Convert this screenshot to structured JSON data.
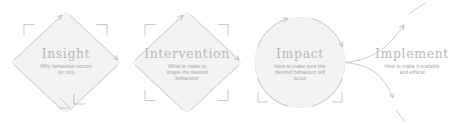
{
  "diagram": {
    "name": "behaviour-change-process",
    "colors": {
      "shape_fill": "#f3f3f3",
      "shape_stroke": "#e3e3e3",
      "arrow_stroke": "#b0b0b0",
      "title_text": "#b9b9b9",
      "desc_text": "#a8a8a8",
      "background": "#ffffff"
    },
    "stages": [
      {
        "id": "insight",
        "shape": "diamond",
        "title": "Insight",
        "desc_lines": [
          "Why behaviour occurs",
          "(or not)"
        ]
      },
      {
        "id": "intervention",
        "shape": "diamond",
        "title": "Intervention",
        "desc_lines": [
          "What to make to",
          "shape the desired",
          "behaviour"
        ]
      },
      {
        "id": "impact",
        "shape": "circle",
        "title": "Impact",
        "desc_lines": [
          "How to make sure the",
          "desired behaviour will",
          "occur"
        ]
      },
      {
        "id": "implement",
        "shape": "none",
        "title": "Implement",
        "desc_lines": [
          "How to make it scalable",
          "and ethical"
        ]
      }
    ]
  }
}
